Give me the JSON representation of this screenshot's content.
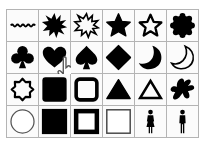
{
  "shape_picker": {
    "columns": 6,
    "rows": 4,
    "cells": [
      {
        "name": "wavy-line",
        "fill": "solid"
      },
      {
        "name": "starburst-12",
        "fill": "solid"
      },
      {
        "name": "starburst-12-frame",
        "fill": "outline"
      },
      {
        "name": "star-5",
        "fill": "solid"
      },
      {
        "name": "star-5-frame",
        "fill": "outline"
      },
      {
        "name": "seal-scalloped",
        "fill": "solid"
      },
      {
        "name": "club",
        "fill": "solid"
      },
      {
        "name": "heart",
        "fill": "solid",
        "hovered": true
      },
      {
        "name": "spade",
        "fill": "solid"
      },
      {
        "name": "diamond",
        "fill": "solid"
      },
      {
        "name": "crescent-moon",
        "fill": "solid"
      },
      {
        "name": "crescent-moon-frame",
        "fill": "outline"
      },
      {
        "name": "seal-8-point-frame",
        "fill": "outline"
      },
      {
        "name": "rounded-square",
        "fill": "solid"
      },
      {
        "name": "rounded-square-frame",
        "fill": "outline"
      },
      {
        "name": "triangle",
        "fill": "solid"
      },
      {
        "name": "triangle-frame",
        "fill": "outline"
      },
      {
        "name": "blob",
        "fill": "solid"
      },
      {
        "name": "circle-thin-frame",
        "fill": "outline"
      },
      {
        "name": "square",
        "fill": "solid"
      },
      {
        "name": "square-thick-frame",
        "fill": "outline"
      },
      {
        "name": "square-thin-frame",
        "fill": "outline"
      },
      {
        "name": "female-figure",
        "fill": "solid"
      },
      {
        "name": "male-figure",
        "fill": "solid"
      }
    ]
  },
  "colors": {
    "shape": "#000000",
    "grid_line": "#b4b4b4",
    "cell_bg": "#fbfbfb"
  },
  "cursor": {
    "icon": "hand-pointer-icon",
    "over_cell": 7
  }
}
